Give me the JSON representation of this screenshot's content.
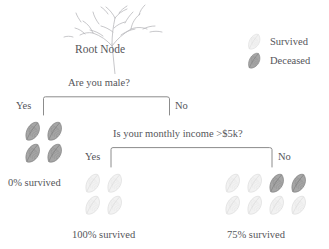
{
  "root": {
    "label": "Root Node",
    "icon": "bare-tree-sketch-icon"
  },
  "legend": {
    "items": [
      {
        "label": "Survived",
        "icon": "leaf-icon",
        "style": "light",
        "color": "#e8e8e8"
      },
      {
        "label": "Deceased",
        "icon": "leaf-icon",
        "style": "dark",
        "color": "#8d8d8d"
      }
    ]
  },
  "questions": [
    {
      "id": "q1",
      "text": "Are you male?"
    },
    {
      "id": "q2",
      "text": "Is your monthly income >$5k?"
    }
  ],
  "edges": [
    {
      "id": "e1-yes",
      "label": "Yes"
    },
    {
      "id": "e1-no",
      "label": "No"
    },
    {
      "id": "e2-yes",
      "label": "Yes"
    },
    {
      "id": "e2-no",
      "label": "No"
    }
  ],
  "nodes": [
    {
      "id": "node-a",
      "outcome": "0% survived",
      "survived_pct": 0,
      "columns": 2,
      "leaves": [
        "dark",
        "dark",
        "dark",
        "dark"
      ],
      "counts": {
        "survived": 0,
        "deceased": 4,
        "total": 4
      }
    },
    {
      "id": "node-b",
      "outcome": "100% survived",
      "survived_pct": 100,
      "columns": 2,
      "leaves": [
        "light",
        "light",
        "light",
        "light"
      ],
      "counts": {
        "survived": 4,
        "deceased": 0,
        "total": 4
      }
    },
    {
      "id": "node-c",
      "outcome": "75% survived",
      "survived_pct": 75,
      "columns": 4,
      "leaves": [
        "light",
        "light",
        "dark",
        "dark",
        "light",
        "light",
        "light",
        "light"
      ],
      "counts": {
        "survived": 6,
        "deceased": 2,
        "total": 8
      }
    }
  ],
  "colors": {
    "light_leaf_fill": "#f2f2f2",
    "light_leaf_stroke": "#dcdcdc",
    "dark_leaf_fill": "#a6a6a6",
    "dark_leaf_stroke": "#7d7d7d",
    "connector": "#8c8c8c",
    "text": "#55555a",
    "background": "#ffffff"
  }
}
